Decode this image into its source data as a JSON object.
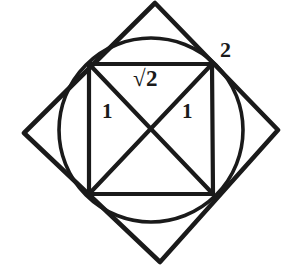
{
  "figure": {
    "stroke_color": "#1a1a1a",
    "background_color": "#ffffff",
    "labels": {
      "outer_diagonal": "2",
      "inner_diagonal": "√2",
      "leg_left": "1",
      "leg_right": "1"
    },
    "shapes": {
      "outer_diamond": {
        "name": "outer-rotated-square",
        "points": "155,3 278,130 160,262 24,133"
      },
      "inscribed_circle": {
        "name": "inscribed-circle",
        "cx": 151,
        "cy": 130,
        "r": 92
      },
      "inner_square": {
        "name": "inner-axis-aligned-square",
        "points": "89,64 212,64 213,194 89,194"
      },
      "diagonals": [
        {
          "name": "diagonal-nw-se",
          "x1": 89,
          "y1": 64,
          "x2": 213,
          "y2": 194
        },
        {
          "name": "diagonal-ne-sw",
          "x1": 212,
          "y1": 64,
          "x2": 89,
          "y2": 194
        }
      ]
    }
  }
}
